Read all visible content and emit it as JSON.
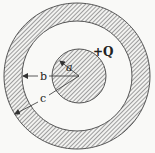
{
  "diagram": {
    "type": "concentric-conductor-cross-section",
    "labels": {
      "charge": "+Q",
      "inner_radius": "a",
      "shell_inner_radius": "b",
      "shell_outer_radius": "c"
    },
    "colors": {
      "background": "#f9f9f7",
      "hatch": "#6e6e6e",
      "outline": "#555555",
      "label": "#222222"
    }
  }
}
